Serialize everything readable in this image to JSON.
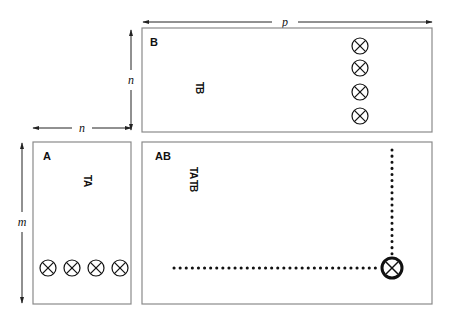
{
  "dimensions": {
    "p": "p",
    "n_top": "n",
    "n_left": "n",
    "m": "m"
  },
  "matrices": {
    "B": {
      "label": "B",
      "inner_label_prefix": "T",
      "inner_label_main": "B"
    },
    "A": {
      "label": "A",
      "inner_label_prefix": "T",
      "inner_label_main": "A"
    },
    "AB": {
      "label": "AB",
      "inner_label_t1": "T",
      "inner_label_a": "A",
      "inner_label_t2": "T",
      "inner_label_b": "B"
    }
  },
  "symbols": {
    "otimes": "circled-times",
    "B_column_count": 4,
    "A_row_count": 4
  },
  "colors": {
    "box_stroke": "#8a8a8a",
    "ink": "#111111",
    "dotted": "#111111"
  }
}
